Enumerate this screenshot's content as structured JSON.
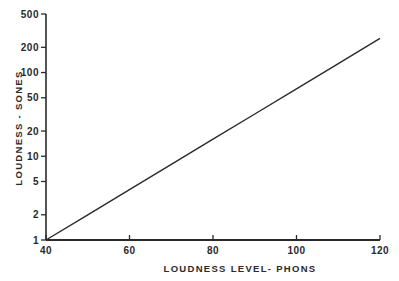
{
  "chart_data": {
    "type": "line",
    "title": "",
    "xlabel": "LOUDNESS LEVEL- PHONS",
    "ylabel": "LOUDNESS - SONES",
    "xscale": "linear",
    "yscale": "log",
    "xlim": [
      40,
      120
    ],
    "ylim": [
      1,
      500
    ],
    "xticks": [
      40,
      60,
      80,
      100,
      120
    ],
    "xtick_labels": [
      "40",
      "60",
      "80",
      "100",
      "120"
    ],
    "yticks": [
      1,
      2,
      5,
      10,
      20,
      50,
      100,
      200,
      500
    ],
    "ytick_labels": [
      "1",
      "2",
      "5",
      "10",
      "20",
      "50",
      "100",
      "200",
      "500"
    ],
    "grid": false,
    "legend": null,
    "series": [
      {
        "name": "Loudness vs Loudness Level",
        "x": [
          40,
          50,
          60,
          70,
          80,
          90,
          100,
          110,
          120
        ],
        "y": [
          1,
          2,
          4,
          8,
          16,
          32,
          64,
          128,
          256
        ]
      }
    ],
    "colors": {
      "line": "#2a2a2a",
      "axis": "#2a2a2a",
      "background": "#ffffff"
    }
  }
}
